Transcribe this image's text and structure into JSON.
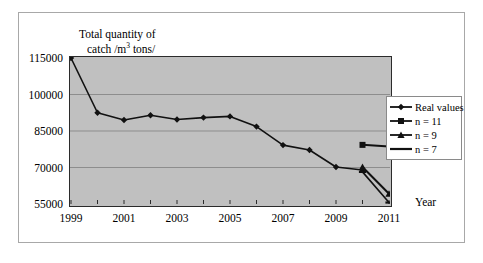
{
  "chart_data": {
    "type": "line",
    "title": "",
    "ylabel_line1": "Total quantity of",
    "ylabel_line2_pre": "catch /m",
    "ylabel_line2_sup": "3",
    "ylabel_line2_post": " tons/",
    "xlabel": "Year",
    "x": [
      1999,
      2000,
      2001,
      2002,
      2003,
      2004,
      2005,
      2006,
      2007,
      2008,
      2009,
      2010,
      2011
    ],
    "xlim": [
      1999,
      2011
    ],
    "ylim": [
      55000,
      115000
    ],
    "yticks": [
      55000,
      70000,
      85000,
      100000,
      115000
    ],
    "ytick_labels": [
      "55000",
      "70000",
      "85000",
      "100000",
      "115000"
    ],
    "xticks": [
      1999,
      2000,
      2001,
      2002,
      2003,
      2004,
      2005,
      2006,
      2007,
      2008,
      2009,
      2010,
      2011
    ],
    "xtick_labels_shown": [
      "1999",
      "2001",
      "2003",
      "2005",
      "2007",
      "2009",
      "2011"
    ],
    "grid": true,
    "grid_axis": "y",
    "legend_position": "right",
    "plot_background": "#c0c0c0",
    "line_color": "#1a1a1a",
    "series": [
      {
        "name": "Real values",
        "marker": "diamond",
        "x": [
          1999,
          2000,
          2001,
          2002,
          2003,
          2004,
          2005,
          2006,
          2007,
          2008,
          2009,
          2010
        ],
        "values": [
          115000,
          92500,
          89500,
          91500,
          89700,
          90500,
          91000,
          86800,
          79200,
          77200,
          70200,
          69000
        ]
      },
      {
        "name": "n = 11",
        "marker": "square",
        "x": [
          2010,
          2011
        ],
        "values": [
          79300,
          78600
        ]
      },
      {
        "name": "n = 9",
        "marker": "triangle",
        "x": [
          2010,
          2011
        ],
        "values": [
          70200,
          59200
        ]
      },
      {
        "name": "n = 7",
        "marker": "line",
        "x": [
          2010,
          2011
        ],
        "values": [
          68200,
          55600
        ]
      }
    ]
  },
  "legend": {
    "items": [
      {
        "label": "Real values",
        "marker": "diamond"
      },
      {
        "label": "n = 11",
        "marker": "square"
      },
      {
        "label": "n = 9",
        "marker": "triangle"
      },
      {
        "label": "n = 7",
        "marker": "line"
      }
    ]
  }
}
